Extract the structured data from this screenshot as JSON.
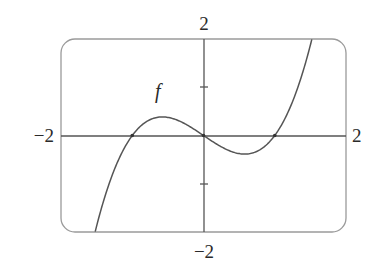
{
  "chart_data": {
    "type": "line",
    "title": "",
    "xlabel": "",
    "ylabel": "",
    "xlim": [
      -2,
      2
    ],
    "ylim": [
      -2,
      2
    ],
    "grid": false,
    "legend": null,
    "tick_labels": {
      "x_left": "−2",
      "x_right": "2",
      "y_top": "2",
      "y_bottom": "−2"
    },
    "y_ticks": [
      -1,
      1
    ],
    "series": [
      {
        "name": "f",
        "formula": "x^3 - x",
        "x": [
          -1.52,
          -1.25,
          -1.0,
          -0.75,
          -0.577,
          -0.25,
          0,
          0.25,
          0.577,
          0.75,
          1.0,
          1.25,
          1.52
        ],
        "y": [
          -2.0,
          -0.7,
          0,
          0.33,
          0.385,
          0.23,
          0,
          -0.23,
          -0.385,
          -0.33,
          0,
          0.7,
          2.0
        ]
      }
    ],
    "annotations": [
      {
        "text": "f",
        "x": -0.67,
        "y": 0.95
      }
    ],
    "x_intercepts": [
      -1,
      0,
      1
    ]
  },
  "colors": {
    "frame": "#9a9a9a",
    "axes": "#555555",
    "curve": "#555555",
    "text": "#2a2a2a"
  }
}
